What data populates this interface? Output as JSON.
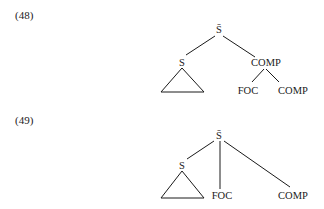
{
  "examples": [
    {
      "number": "(48)",
      "nodes": {
        "root": "S̄",
        "left": "S",
        "right": "COMP",
        "right_child_1": "FOC",
        "right_child_2": "COMP"
      }
    },
    {
      "number": "(49)",
      "nodes": {
        "root": "S̄",
        "left": "S",
        "middle": "FOC",
        "right": "COMP"
      }
    }
  ],
  "colors": {
    "ink": "#1a1a1a",
    "background": "#ffffff"
  }
}
